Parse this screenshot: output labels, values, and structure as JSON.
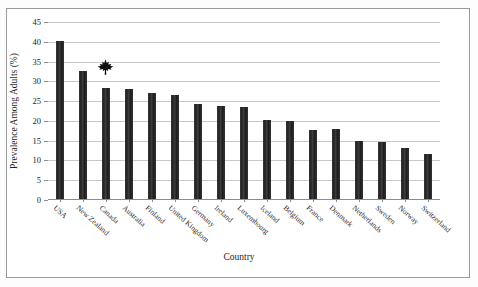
{
  "chart_data": {
    "type": "bar",
    "title": "",
    "xlabel": "Country",
    "ylabel": "Prevalence Among Adults (%)",
    "ylim": [
      0,
      45
    ],
    "ytick_step": 5,
    "yticks": [
      0,
      5,
      10,
      15,
      20,
      25,
      30,
      35,
      40,
      45
    ],
    "grid": true,
    "legend": "none",
    "bar_color": "#2b2b2b",
    "categories": [
      "USA",
      "New Zealand",
      "Canada",
      "Australia",
      "Finland",
      "United Kingdom",
      "Germany",
      "Ireland",
      "Luxembourg",
      "Iceland",
      "Belgium",
      "France",
      "Denmark",
      "Netherlands",
      "Sweden",
      "Norway",
      "Switzerland"
    ],
    "values": [
      40.0,
      32.3,
      28.0,
      27.8,
      26.9,
      26.4,
      23.9,
      23.6,
      23.2,
      20.0,
      19.8,
      17.5,
      17.6,
      14.6,
      14.5,
      13.0,
      11.3
    ],
    "annotations": [
      {
        "name": "maple-leaf",
        "icon": "maple-leaf-icon",
        "category": "Canada",
        "value": 33.5,
        "color": "#111111"
      }
    ]
  }
}
